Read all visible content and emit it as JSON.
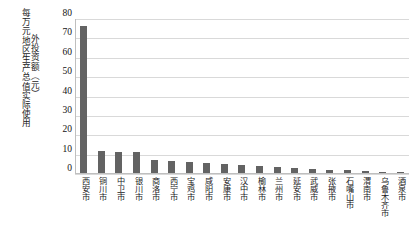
{
  "chart_data": {
    "type": "bar",
    "title": "",
    "xlabel": "",
    "ylabel_columns": [
      "每万元地区生产总值实际使用",
      "外投资额（元）"
    ],
    "ylabel": "每万元地区生产总值实际使用外投资额（元）",
    "ylim": [
      0,
      80
    ],
    "yticks": [
      80,
      70,
      60,
      50,
      40,
      30,
      20,
      10,
      0
    ],
    "grid": true,
    "legend": "none",
    "bar_color": "#636363",
    "gridline_color": "#d9d9d9",
    "axis_color": "#bfbfbf",
    "categories": [
      "西安市",
      "铜川市",
      "中卫市",
      "银川市",
      "商洛市",
      "西宁市",
      "宝鸡市",
      "咸阳市",
      "安康市",
      "汉中市",
      "榆林市",
      "兰州市",
      "延安市",
      "武威市",
      "张掖市",
      "石嘴山市",
      "渭南市",
      "乌鲁木齐市",
      "酒泉市"
    ],
    "values": [
      76.0,
      11.5,
      11.0,
      11.0,
      6.5,
      6.0,
      5.5,
      5.0,
      4.5,
      4.0,
      3.6,
      3.2,
      2.8,
      2.2,
      1.8,
      1.4,
      1.0,
      0.5,
      0.3
    ]
  }
}
